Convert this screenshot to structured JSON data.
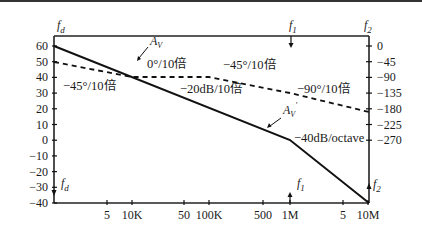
{
  "chart_data": {
    "type": "line",
    "xscale": "log",
    "x_tick_labels": [
      "5",
      "10K",
      "50",
      "100K",
      "500",
      "1M",
      "5",
      "10M"
    ],
    "x_tick_values": [
      5000,
      10000,
      50000,
      100000,
      500000,
      1000000,
      5000000,
      10000000
    ],
    "left_axis": {
      "label": "dB",
      "ticks": [
        "60",
        "50",
        "40",
        "30",
        "20",
        "10",
        "0",
        "-10",
        "-20",
        "-30",
        "-40"
      ],
      "range": [
        -40,
        60
      ]
    },
    "right_axis": {
      "label": "phase (°)",
      "ticks": [
        "0",
        "-45",
        "-90",
        "-135",
        "-180",
        "-225",
        "-270"
      ],
      "range": [
        -270,
        0
      ]
    },
    "series": [
      {
        "name": "A_V",
        "style": "solid",
        "axis": "left",
        "points": [
          [
            1000,
            60
          ],
          [
            1000000,
            0
          ],
          [
            10000000,
            -40
          ]
        ]
      },
      {
        "name": "phase",
        "style": "dashed",
        "axis": "right",
        "points": [
          [
            1000,
            -45
          ],
          [
            10000,
            -90
          ],
          [
            100000,
            -90
          ],
          [
            1000000,
            -180
          ],
          [
            10000000,
            -270
          ]
        ]
      }
    ],
    "annotations": [
      {
        "text": "f_d",
        "where": "top-left"
      },
      {
        "text": "f_d",
        "where": "bottom-left"
      },
      {
        "text": "f_1",
        "where": "top at 1M"
      },
      {
        "text": "f_1",
        "where": "bottom at 1M"
      },
      {
        "text": "f_2",
        "where": "top-right"
      },
      {
        "text": "f_2",
        "where": "bottom-right"
      },
      {
        "text": "A_V",
        "where": "gain curve label"
      },
      {
        "text": "A_V'",
        "where": "second gain curve label"
      },
      {
        "text": "-45°/10倍"
      },
      {
        "text": "0°/10倍"
      },
      {
        "text": "-45°/10倍"
      },
      {
        "text": "-20dB/10倍"
      },
      {
        "text": "-90°/10倍"
      },
      {
        "text": "-40dB/octave"
      }
    ],
    "grid": false,
    "legend": "none"
  },
  "labels": {
    "fd_top": "f",
    "fd_sub": "d",
    "f1_top": "f",
    "f1_sub": "1",
    "f2_top": "f",
    "f2_sub": "2",
    "av": "A",
    "av_sub": "V",
    "avp_sub": "V",
    "avp_prime": "'",
    "phase_left": "−45°/10倍",
    "phase_flat": "0°/10倍",
    "phase_mid": "−45°/10倍",
    "gain_slope1": "−20dB/10倍",
    "phase_right": "−90°/10倍",
    "gain_slope2": "−40dB/octave"
  },
  "left_ticks": [
    "60",
    "50",
    "40",
    "30",
    "20",
    "10",
    "0",
    "−10",
    "−20",
    "−30",
    "−40"
  ],
  "right_ticks": [
    "0",
    "−45",
    "−90",
    "−135",
    "−180",
    "−225",
    "−270"
  ],
  "x_ticks": [
    "5",
    "10K",
    "50",
    "100K",
    "500",
    "1M",
    "5",
    "10M"
  ]
}
